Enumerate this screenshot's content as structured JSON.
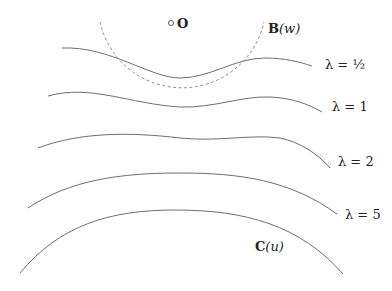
{
  "diagram": {
    "origin": {
      "label": "O",
      "x": 180,
      "y": 25
    },
    "ball": {
      "label_bold": "B",
      "label_arg": "(w)",
      "style": "dashed",
      "center": [
        180,
        22
      ],
      "radius": 84
    },
    "curves": [
      {
        "id": "lambda-half",
        "label": "λ = ½",
        "label_pos": [
          325,
          58
        ],
        "path": "M62,48 C110,46 150,78 180,78 C210,78 235,58 265,58 C285,58 300,62 312,66"
      },
      {
        "id": "lambda-1",
        "label": "λ = 1",
        "label_pos": [
          332,
          100
        ],
        "path": "M48,96 C90,84 130,104 180,107 C215,108 240,96 270,97 C292,98 308,104 322,112"
      },
      {
        "id": "lambda-2",
        "label": "λ = 2",
        "label_pos": [
          338,
          155
        ],
        "path": "M38,148 C80,132 130,132 180,138 C220,142 250,134 280,138 C300,142 318,154 330,168"
      },
      {
        "id": "lambda-5",
        "label": "λ = 5",
        "label_pos": [
          345,
          208
        ],
        "path": "M28,208 C70,180 120,173 180,173 C240,173 290,180 337,214"
      },
      {
        "id": "curve-c",
        "label_bold": "C",
        "label_arg": "(u)",
        "label_pos": [
          255,
          240
        ],
        "path": "M20,273 C60,225 110,210 175,210 C245,210 300,225 343,274"
      }
    ]
  }
}
